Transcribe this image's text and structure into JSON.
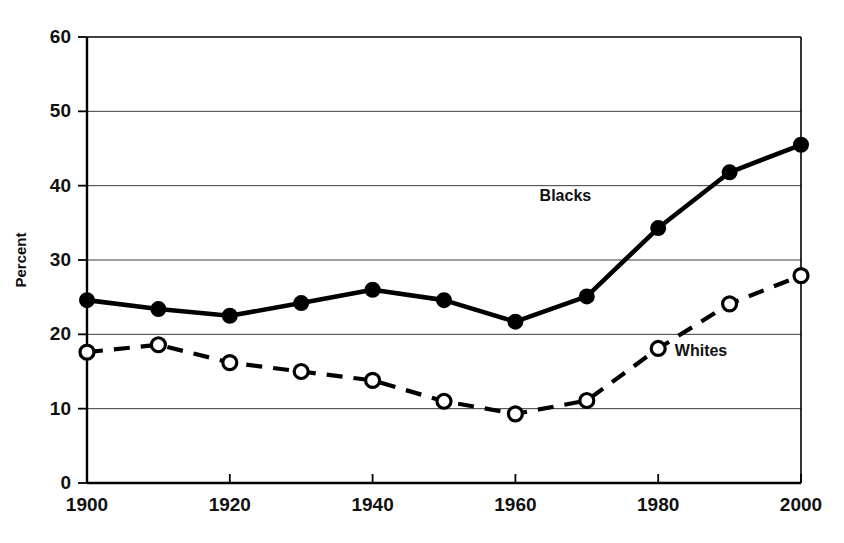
{
  "chart_data": {
    "type": "line",
    "title": "",
    "xlabel": "",
    "ylabel": "Percent",
    "x": [
      1900,
      1910,
      1920,
      1930,
      1940,
      1950,
      1960,
      1970,
      1980,
      1990,
      2000
    ],
    "xlim": [
      1900,
      2000
    ],
    "ylim": [
      0,
      60
    ],
    "xticks": [
      1900,
      1920,
      1940,
      1960,
      1980,
      2000
    ],
    "xtick_labels": [
      "1900",
      "1920",
      "1940",
      "1960",
      "1980",
      "2000"
    ],
    "yticks": [
      0,
      10,
      20,
      30,
      40,
      50,
      60
    ],
    "ytick_labels": [
      "0",
      "10",
      "20",
      "30",
      "40",
      "50",
      "60"
    ],
    "grid": true,
    "legend_position": "inline-annotations",
    "series": [
      {
        "name": "Blacks",
        "marker": "filled-circle",
        "line_style": "solid",
        "color": "#000000",
        "label_x": 1967,
        "label_y": 38.5,
        "values": [
          24.6,
          23.4,
          22.5,
          24.2,
          26.0,
          24.6,
          21.7,
          25.1,
          34.3,
          41.8,
          45.5
        ]
      },
      {
        "name": "Whites",
        "marker": "open-circle",
        "line_style": "dashed",
        "color": "#000000",
        "label_x": 1986,
        "label_y": 17.6,
        "values": [
          17.6,
          18.6,
          16.2,
          15.0,
          13.8,
          11.0,
          9.3,
          11.1,
          18.1,
          24.1,
          27.9
        ]
      }
    ]
  }
}
